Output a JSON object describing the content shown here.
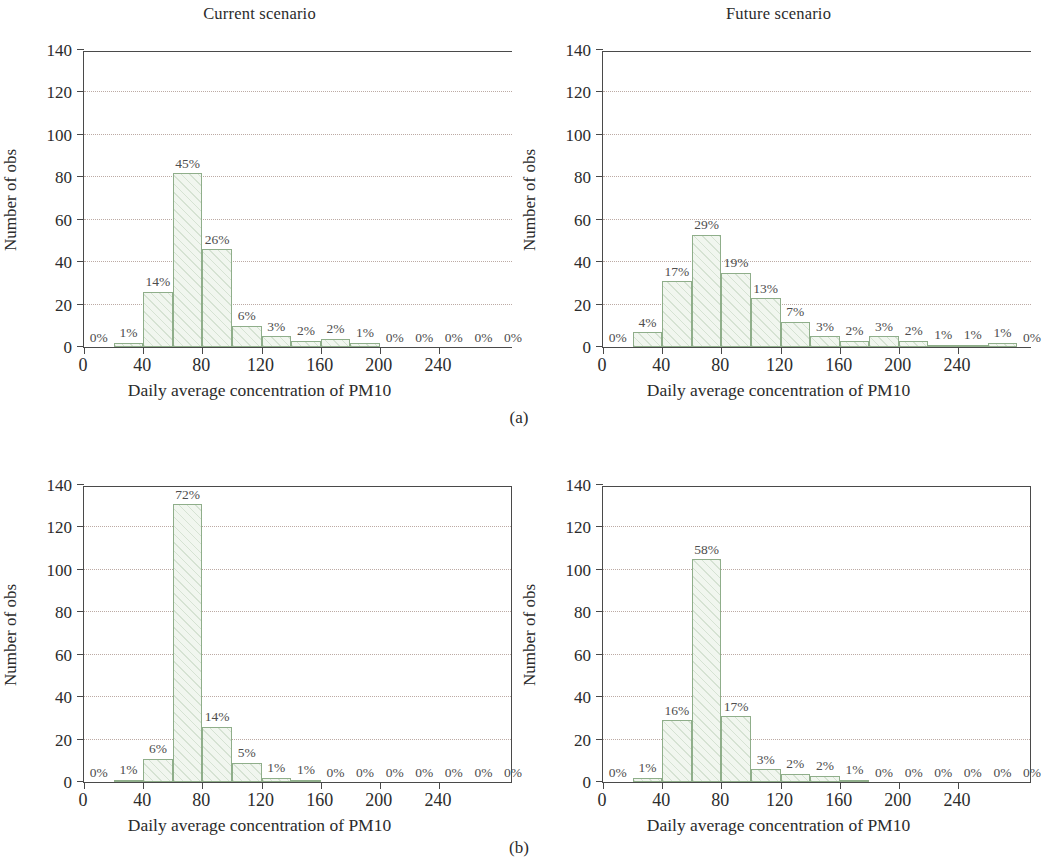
{
  "figure": {
    "captions": {
      "a": "(a)",
      "b": "(b)"
    },
    "axis": {
      "ylabel": "Number of obs",
      "xlabel": "Daily average concentration of PM10",
      "yticks": [
        0,
        20,
        40,
        60,
        80,
        100,
        120,
        140
      ],
      "xticks": [
        0,
        40,
        80,
        120,
        160,
        200,
        240
      ],
      "ylim": [
        0,
        140
      ],
      "xlim": [
        0,
        290
      ],
      "bin_width": 20,
      "grid": "horizontal-dotted"
    },
    "colors": {
      "bar_edge": "#8fae8a",
      "bar_fill": "#f1f6ef",
      "axis": "#4a4a4a",
      "grid": "#b9a6a0",
      "text": "#2b2b2b",
      "label_text": "#4d4d4d"
    }
  },
  "chart_data": [
    {
      "id": "panel-a-current",
      "type": "bar",
      "title": "Current scenario",
      "xlabel": "Daily average concentration of PM10",
      "ylabel": "Number of obs",
      "xlim": [
        0,
        290
      ],
      "ylim": [
        0,
        140
      ],
      "xticks": [
        0,
        40,
        80,
        120,
        160,
        200,
        240
      ],
      "yticks": [
        0,
        20,
        40,
        60,
        80,
        100,
        120,
        140
      ],
      "grid": true,
      "bin_width": 20,
      "bin_starts": [
        0,
        20,
        40,
        60,
        80,
        100,
        120,
        140,
        160,
        180,
        200,
        220,
        240,
        260,
        280
      ],
      "categories": [
        "0-20",
        "20-40",
        "40-60",
        "60-80",
        "80-100",
        "100-120",
        "120-140",
        "140-160",
        "160-180",
        "180-200",
        "200-220",
        "220-240",
        "240-260",
        "260-280",
        "280-300"
      ],
      "values": [
        0,
        2,
        26,
        82,
        46,
        10,
        5,
        3,
        4,
        2,
        0,
        0,
        0,
        0,
        0
      ],
      "data_labels": [
        "0%",
        "1%",
        "14%",
        "45%",
        "26%",
        "6%",
        "3%",
        "2%",
        "2%",
        "1%",
        "0%",
        "0%",
        "0%",
        "0%",
        "0%"
      ]
    },
    {
      "id": "panel-a-future",
      "type": "bar",
      "title": "Future scenario",
      "xlabel": "Daily average concentration of PM10",
      "ylabel": "Number of obs",
      "xlim": [
        0,
        290
      ],
      "ylim": [
        0,
        140
      ],
      "xticks": [
        0,
        40,
        80,
        120,
        160,
        200,
        240
      ],
      "yticks": [
        0,
        20,
        40,
        60,
        80,
        100,
        120,
        140
      ],
      "grid": true,
      "bin_width": 20,
      "bin_starts": [
        0,
        20,
        40,
        60,
        80,
        100,
        120,
        140,
        160,
        180,
        200,
        220,
        240,
        260,
        280
      ],
      "categories": [
        "0-20",
        "20-40",
        "40-60",
        "60-80",
        "80-100",
        "100-120",
        "120-140",
        "140-160",
        "160-180",
        "180-200",
        "200-220",
        "220-240",
        "240-260",
        "260-280",
        "280-300"
      ],
      "values": [
        0,
        7,
        31,
        53,
        35,
        23,
        12,
        5,
        3,
        5,
        3,
        1,
        1,
        2,
        0
      ],
      "data_labels": [
        "0%",
        "4%",
        "17%",
        "29%",
        "19%",
        "13%",
        "7%",
        "3%",
        "2%",
        "3%",
        "2%",
        "1%",
        "1%",
        "1%",
        "0%"
      ]
    },
    {
      "id": "panel-b-current",
      "type": "bar",
      "title": "",
      "xlabel": "Daily average concentration of PM10",
      "ylabel": "Number of obs",
      "xlim": [
        0,
        290
      ],
      "ylim": [
        0,
        140
      ],
      "xticks": [
        0,
        40,
        80,
        120,
        160,
        200,
        240
      ],
      "yticks": [
        0,
        20,
        40,
        60,
        80,
        100,
        120,
        140
      ],
      "grid": true,
      "bin_width": 20,
      "bin_starts": [
        0,
        20,
        40,
        60,
        80,
        100,
        120,
        140,
        160,
        180,
        200,
        220,
        240,
        260,
        280
      ],
      "categories": [
        "0-20",
        "20-40",
        "40-60",
        "60-80",
        "80-100",
        "100-120",
        "120-140",
        "140-160",
        "160-180",
        "180-200",
        "200-220",
        "220-240",
        "240-260",
        "260-280",
        "280-300"
      ],
      "values": [
        0,
        1,
        11,
        131,
        26,
        9,
        2,
        1,
        0,
        0,
        0,
        0,
        0,
        0,
        0
      ],
      "data_labels": [
        "0%",
        "1%",
        "6%",
        "72%",
        "14%",
        "5%",
        "1%",
        "1%",
        "0%",
        "0%",
        "0%",
        "0%",
        "0%",
        "0%",
        "0%"
      ]
    },
    {
      "id": "panel-b-future",
      "type": "bar",
      "title": "",
      "xlabel": "Daily average concentration of PM10",
      "ylabel": "Number of obs",
      "xlim": [
        0,
        290
      ],
      "ylim": [
        0,
        140
      ],
      "xticks": [
        0,
        40,
        80,
        120,
        160,
        200,
        240
      ],
      "yticks": [
        0,
        20,
        40,
        60,
        80,
        100,
        120,
        140
      ],
      "grid": true,
      "bin_width": 20,
      "bin_starts": [
        0,
        20,
        40,
        60,
        80,
        100,
        120,
        140,
        160,
        180,
        200,
        220,
        240,
        260,
        280
      ],
      "categories": [
        "0-20",
        "20-40",
        "40-60",
        "60-80",
        "80-100",
        "100-120",
        "120-140",
        "140-160",
        "160-180",
        "180-200",
        "200-220",
        "220-240",
        "240-260",
        "260-280",
        "280-300"
      ],
      "values": [
        0,
        2,
        29,
        105,
        31,
        6,
        4,
        3,
        1,
        0,
        0,
        0,
        0,
        0,
        0
      ],
      "data_labels": [
        "0%",
        "1%",
        "16%",
        "58%",
        "17%",
        "3%",
        "2%",
        "2%",
        "1%",
        "0%",
        "0%",
        "0%",
        "0%",
        "0%",
        "0%"
      ]
    }
  ]
}
